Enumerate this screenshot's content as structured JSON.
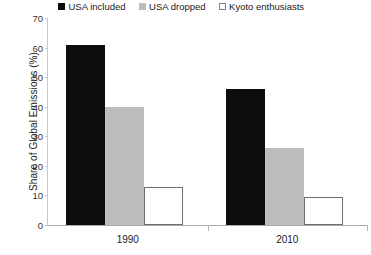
{
  "chart_data": {
    "type": "bar",
    "title": "",
    "xlabel": "",
    "ylabel": "Share of Global Emissions (%)",
    "categories": [
      "1990",
      "2010"
    ],
    "series": [
      {
        "name": "USA included",
        "values": [
          61,
          46
        ],
        "color": "#0d0d0d"
      },
      {
        "name": "USA dropped",
        "values": [
          40,
          26
        ],
        "color": "#bdbdbd"
      },
      {
        "name": "Kyoto enthusiasts",
        "values": [
          13,
          9.5
        ],
        "color": "#ffffff"
      }
    ],
    "ylim": [
      0,
      70
    ],
    "ytick_step": 10,
    "yticks": [
      0,
      10,
      20,
      30,
      40,
      50,
      60,
      70
    ],
    "grid": false,
    "legend_position": "top"
  },
  "legend": {
    "items": [
      {
        "label": "USA included",
        "swatch": "black-square-icon"
      },
      {
        "label": "USA dropped",
        "swatch": "gray-square-icon"
      },
      {
        "label": "Kyoto enthusiasts",
        "swatch": "white-square-icon"
      }
    ]
  },
  "axes": {
    "y_title": "Share of Global Emissions (%)",
    "y_tick_labels": [
      "0",
      "10",
      "20",
      "30",
      "40",
      "50",
      "60",
      "70"
    ],
    "x_tick_labels": [
      "1990",
      "2010"
    ]
  },
  "colors": {
    "series_black": "#0d0d0d",
    "series_gray": "#bdbdbd",
    "series_white": "#ffffff",
    "axis": "#a8a8a8",
    "text": "#1a1a1a",
    "background": "#ffffff"
  }
}
